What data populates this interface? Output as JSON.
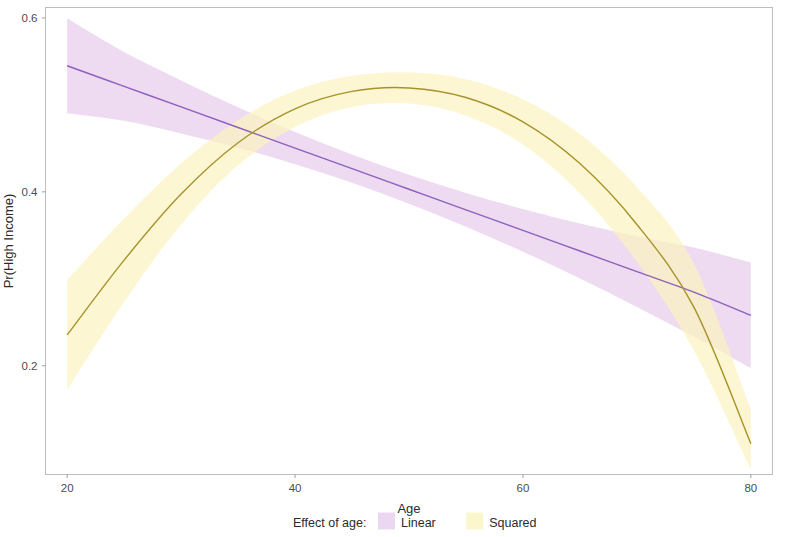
{
  "chart_data": {
    "type": "line",
    "title": "",
    "subtitle": "",
    "xlabel": "Age",
    "ylabel": "Pr(High Income)",
    "xlim": [
      18.1,
      81.9
    ],
    "ylim": [
      0.075,
      0.612
    ],
    "xticks": [
      20,
      40,
      60,
      80
    ],
    "xtick_labels": [
      "20",
      "40",
      "60",
      "80"
    ],
    "yticks": [
      0.2,
      0.4,
      0.6
    ],
    "ytick_labels": [
      "0.2",
      "0.4",
      "0.6"
    ],
    "grid": false,
    "legend_position": "bottom",
    "legend_title": "Effect of age:",
    "x": [
      20,
      25,
      30,
      35,
      40,
      45,
      50,
      55,
      60,
      65,
      70,
      75,
      80
    ],
    "series": [
      {
        "name": "Linear",
        "color": "#8f5fbf",
        "band_color": "#e7cdec",
        "values": [
          0.545,
          0.5213,
          0.4977,
          0.474,
          0.4503,
          0.4267,
          0.403,
          0.3793,
          0.3557,
          0.332,
          0.3083,
          0.2847,
          0.258
        ],
        "band_lower": [
          0.4905,
          0.4818,
          0.4672,
          0.4508,
          0.4318,
          0.4104,
          0.3864,
          0.3598,
          0.3312,
          0.3004,
          0.2676,
          0.2334,
          0.1972
        ],
        "band_upper": [
          0.5995,
          0.5608,
          0.5282,
          0.4972,
          0.4688,
          0.443,
          0.4196,
          0.3988,
          0.3802,
          0.3636,
          0.349,
          0.336,
          0.3188
        ]
      },
      {
        "name": "Squared",
        "color": "#a8912a",
        "band_color": "#fbf4c0",
        "values": [
          0.2355,
          0.3215,
          0.3975,
          0.4565,
          0.4955,
          0.5155,
          0.5195,
          0.5085,
          0.4805,
          0.4325,
          0.3625,
          0.2675,
          0.1105
        ],
        "band_lower": [
          0.1725,
          0.2735,
          0.3625,
          0.4305,
          0.4745,
          0.4975,
          0.5015,
          0.4875,
          0.4545,
          0.3985,
          0.3195,
          0.2175,
          0.0805
        ],
        "band_upper": [
          0.2985,
          0.3695,
          0.4325,
          0.4825,
          0.5165,
          0.5335,
          0.5375,
          0.5295,
          0.5065,
          0.4665,
          0.4055,
          0.3175,
          0.1505
        ]
      }
    ],
    "annotations": []
  },
  "legend": {
    "title": "Effect of age:",
    "items": [
      {
        "label": "Linear",
        "color": "#e7cdec"
      },
      {
        "label": "Squared",
        "color": "#fbf4c0"
      }
    ]
  },
  "axes": {
    "x": {
      "title": "Age",
      "labels": [
        "20",
        "40",
        "60",
        "80"
      ]
    },
    "y": {
      "title": "Pr(High Income)",
      "labels": [
        "0.6",
        "0.4",
        "0.2"
      ]
    }
  }
}
